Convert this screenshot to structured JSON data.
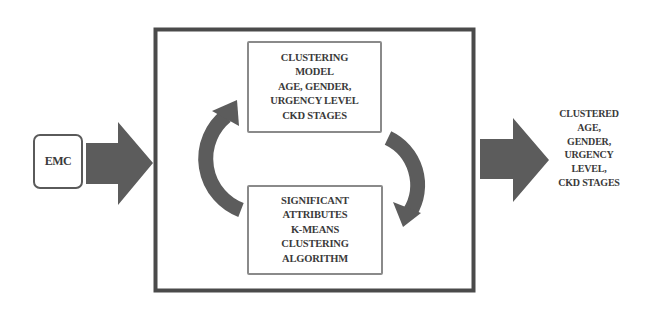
{
  "diagram": {
    "input": {
      "label": "EMC"
    },
    "process": {
      "top_box": {
        "lines": [
          "CLUSTERING",
          "MODEL",
          "AGE, GENDER,",
          "URGENCY LEVEL",
          "CKD STAGES"
        ]
      },
      "bottom_box": {
        "lines": [
          "SIGNIFICANT",
          "ATTRIBUTES",
          "K-MEANS",
          "CLUSTERING",
          "ALGORITHM"
        ]
      },
      "cycle_arrows": [
        "left-arc-up-arrow",
        "right-arc-down-arrow"
      ]
    },
    "output": {
      "lines": [
        "CLUSTERED",
        "AGE,",
        "GENDER,",
        "URGENCY",
        "LEVEL,",
        "CKD STAGES"
      ]
    },
    "colors": {
      "arrow_fill": "#5c5c5c",
      "frame_border": "#4a4a4a",
      "inner_box_border": "#8a8a8a",
      "text": "#3a3a3a",
      "background": "#ffffff"
    }
  }
}
